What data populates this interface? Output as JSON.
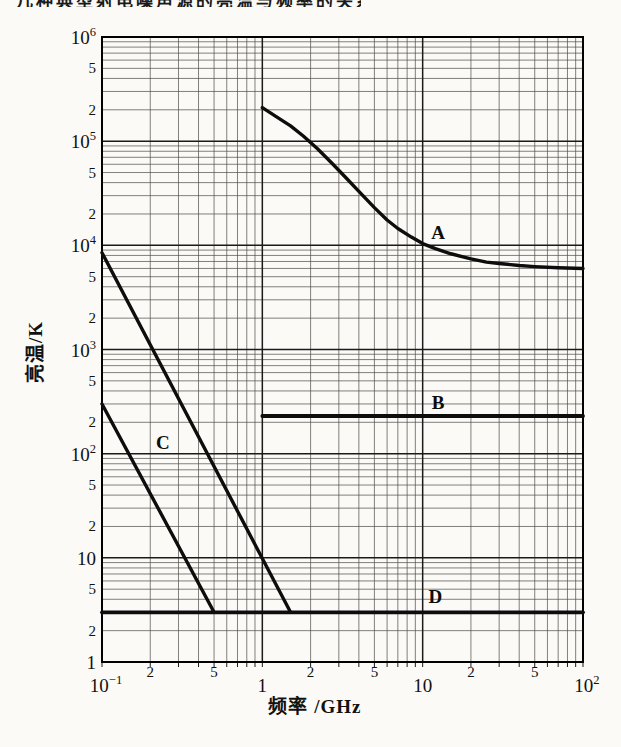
{
  "page": {
    "cropped_top_text": "几种典型射电噪声源的亮温与频率的关系图",
    "background_color": "#fbfaf7",
    "ink_color": "#0d0d0d"
  },
  "chart_data": {
    "type": "line",
    "title": "",
    "xlabel": "频率 /GHz",
    "ylabel": "亮温/K",
    "x_scale": "log",
    "y_scale": "log",
    "xlim": [
      0.1,
      100
    ],
    "ylim": [
      1,
      1000000
    ],
    "grid": "full log-log graph paper, minor lines 2-9 every decade, grid on",
    "legend_position": "inline curve labels",
    "line_color": "#0d0d0d",
    "x_ticks": [
      {
        "v": 0.1,
        "t": "10",
        "e": "−1",
        "major": true
      },
      {
        "v": 0.2,
        "t": "2"
      },
      {
        "v": 0.5,
        "t": "5"
      },
      {
        "v": 1,
        "t": "1",
        "major": true
      },
      {
        "v": 2,
        "t": "2"
      },
      {
        "v": 5,
        "t": "5"
      },
      {
        "v": 10,
        "t": "10",
        "major": true
      },
      {
        "v": 20,
        "t": "2"
      },
      {
        "v": 50,
        "t": "5"
      },
      {
        "v": 100,
        "t": "10",
        "e": "2",
        "major": true
      }
    ],
    "y_ticks": [
      {
        "v": 1,
        "t": "1",
        "major": true
      },
      {
        "v": 2,
        "t": "2"
      },
      {
        "v": 5,
        "t": "5"
      },
      {
        "v": 10,
        "t": "10",
        "major": true
      },
      {
        "v": 20,
        "t": "2"
      },
      {
        "v": 50,
        "t": "5"
      },
      {
        "v": 100,
        "t": "10",
        "e": "2",
        "major": true
      },
      {
        "v": 200,
        "t": "2"
      },
      {
        "v": 500,
        "t": "5"
      },
      {
        "v": 1000,
        "t": "10",
        "e": "3",
        "major": true
      },
      {
        "v": 2000,
        "t": "2"
      },
      {
        "v": 5000,
        "t": "5"
      },
      {
        "v": 10000,
        "t": "10",
        "e": "4",
        "major": true
      },
      {
        "v": 20000,
        "t": "2"
      },
      {
        "v": 50000,
        "t": "5"
      },
      {
        "v": 100000,
        "t": "10",
        "e": "5",
        "major": true
      },
      {
        "v": 200000,
        "t": "2"
      },
      {
        "v": 500000,
        "t": "5"
      },
      {
        "v": 1000000,
        "t": "10",
        "e": "6",
        "major": true
      }
    ],
    "series": [
      {
        "name": "A",
        "shape": "smooth descending curve flattening at high frequency",
        "segments": [
          [
            [
              1,
              210000
            ],
            [
              1.2,
              175000
            ],
            [
              1.5,
              140000
            ],
            [
              1.8,
              112000
            ],
            [
              2.2,
              85000
            ],
            [
              2.7,
              62000
            ],
            [
              3.3,
              45000
            ],
            [
              4,
              33000
            ],
            [
              5,
              23000
            ],
            [
              6,
              17500
            ],
            [
              7,
              14500
            ],
            [
              8.5,
              12000
            ],
            [
              10,
              10400
            ],
            [
              12,
              9300
            ],
            [
              15,
              8300
            ],
            [
              20,
              7400
            ],
            [
              25,
              6900
            ],
            [
              30,
              6700
            ],
            [
              40,
              6400
            ],
            [
              50,
              6250
            ],
            [
              70,
              6100
            ],
            [
              100,
              6000
            ]
          ]
        ],
        "label_pos": [
          12.5,
          13500
        ],
        "width": 3.4
      },
      {
        "name": "B",
        "shape": "horizontal line",
        "value_K": 230,
        "segments": [
          [
            [
              1,
              230
            ],
            [
              100,
              230
            ]
          ]
        ],
        "label_pos": [
          12.5,
          315
        ],
        "width": 3.8
      },
      {
        "name": "C",
        "shape": "two parallel steep straight lines (upper and lower bounds)",
        "segments": [
          [
            [
              0.1,
              8500
            ],
            [
              1.5,
              3
            ]
          ],
          [
            [
              0.1,
              300
            ],
            [
              0.5,
              3
            ]
          ]
        ],
        "label_pos": [
          0.24,
          130
        ],
        "width": 3.4
      },
      {
        "name": "D",
        "shape": "horizontal line across full width",
        "value_K": 3,
        "segments": [
          [
            [
              0.1,
              3
            ],
            [
              100,
              3
            ]
          ]
        ],
        "label_pos": [
          12,
          4.3
        ],
        "width": 3.8
      }
    ]
  }
}
